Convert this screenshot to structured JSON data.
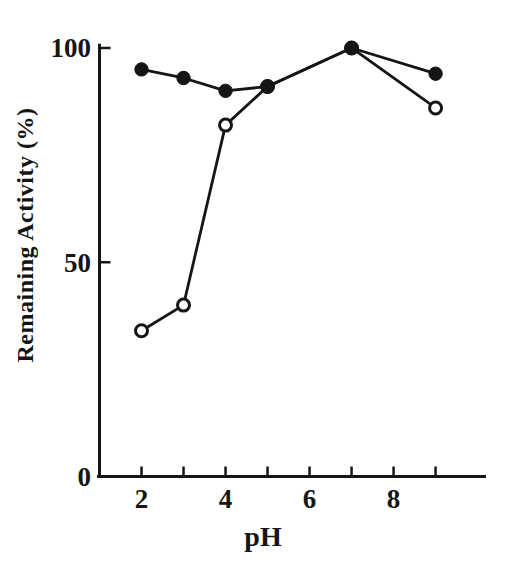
{
  "chart_data": {
    "type": "line",
    "title": "",
    "xlabel": "pH",
    "ylabel": "Remaining Activity (%)",
    "x": [
      2,
      3,
      4,
      5,
      7,
      9
    ],
    "series": [
      {
        "name": "filled-circle-series",
        "marker": "filled-circle",
        "values": [
          95,
          93,
          90,
          91,
          100,
          94
        ]
      },
      {
        "name": "open-circle-series",
        "marker": "open-circle",
        "values": [
          34,
          40,
          82,
          91,
          100,
          86
        ]
      }
    ],
    "xlim": [
      1,
      10.2
    ],
    "ylim": [
      0,
      101
    ],
    "x_ticks": [
      {
        "value": 2,
        "label": "2"
      },
      {
        "value": 3,
        "label": ""
      },
      {
        "value": 4,
        "label": "4"
      },
      {
        "value": 5,
        "label": ""
      },
      {
        "value": 6,
        "label": "6"
      },
      {
        "value": 7,
        "label": ""
      },
      {
        "value": 8,
        "label": "8"
      },
      {
        "value": 9,
        "label": ""
      }
    ],
    "y_ticks": [
      {
        "value": 0,
        "label": "0"
      },
      {
        "value": 50,
        "label": "50"
      },
      {
        "value": 100,
        "label": "100"
      }
    ],
    "grid": false,
    "legend": "none",
    "ink_color": "#151515",
    "background_color": "#ffffff"
  }
}
